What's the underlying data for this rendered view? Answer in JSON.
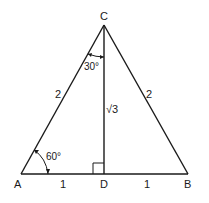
{
  "diagram": {
    "colors": {
      "stroke": "#1a1a1a",
      "background": "#ffffff"
    },
    "vertices": {
      "A": {
        "label": "A",
        "x": 21,
        "y": 174
      },
      "B": {
        "label": "B",
        "x": 188,
        "y": 174
      },
      "C": {
        "label": "C",
        "x": 104,
        "y": 25
      },
      "D": {
        "label": "D",
        "x": 104,
        "y": 174
      }
    },
    "side_labels": {
      "AC": "2",
      "BC": "2",
      "CD": "√3",
      "AD": "1",
      "DB": "1"
    },
    "angle_labels": {
      "A": "60°",
      "C": "30°"
    },
    "right_angle_at": "D"
  }
}
